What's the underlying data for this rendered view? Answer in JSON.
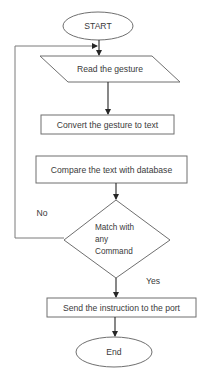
{
  "diagram": {
    "type": "flowchart",
    "nodes": {
      "start": {
        "shape": "terminator",
        "label": "START"
      },
      "read": {
        "shape": "parallelogram",
        "label": "Read the gesture"
      },
      "convert": {
        "shape": "process",
        "label": "Convert the gesture to text"
      },
      "compare": {
        "shape": "process",
        "label": "Compare the text with database"
      },
      "decision": {
        "shape": "decision",
        "label_lines": [
          "Match with",
          "any",
          "Command"
        ]
      },
      "send": {
        "shape": "process",
        "label": "Send the instruction to the port"
      },
      "end": {
        "shape": "terminator",
        "label": "End"
      }
    },
    "edges": [
      {
        "from": "start",
        "to": "read",
        "label": ""
      },
      {
        "from": "read",
        "to": "convert",
        "label": ""
      },
      {
        "from": "compare",
        "to": "decision",
        "label": ""
      },
      {
        "from": "decision",
        "to": "send",
        "label": "Yes"
      },
      {
        "from": "decision",
        "to": "read",
        "label": "No"
      },
      {
        "from": "send",
        "to": "end",
        "label": ""
      }
    ],
    "edge_labels": {
      "no": "No",
      "yes": "Yes"
    }
  }
}
